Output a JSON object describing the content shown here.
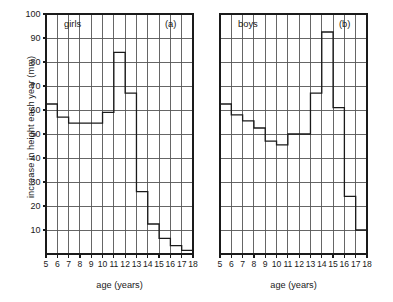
{
  "figure": {
    "ylabel": "increase in height each year (mm)",
    "xlabel_a": "age (years)",
    "xlabel_b": "age (years)"
  },
  "chart_data": [
    {
      "type": "bar",
      "title": "girls",
      "tag": "(a)",
      "xlabel": "age (years)",
      "ylabel": "increase in height each year (mm)",
      "categories": [
        "5-6",
        "6-7",
        "7-8",
        "8-9",
        "9-10",
        "10-11",
        "11-12",
        "12-13",
        "13-14",
        "14-15",
        "15-16",
        "16-17",
        "17-18"
      ],
      "bin_edges": [
        5,
        6,
        7,
        8,
        9,
        10,
        11,
        12,
        13,
        14,
        15,
        16,
        17,
        18
      ],
      "values": [
        62.5,
        57,
        54.5,
        54.5,
        54.5,
        59,
        84,
        67,
        26,
        12.5,
        6.5,
        3.5,
        1.5
      ],
      "xlim": [
        5,
        18
      ],
      "ylim": [
        0,
        100
      ],
      "yticks": [
        10,
        20,
        30,
        40,
        50,
        60,
        70,
        80,
        90,
        100
      ],
      "xticks": [
        5,
        6,
        7,
        8,
        9,
        10,
        11,
        12,
        13,
        14,
        15,
        16,
        17,
        18
      ],
      "grid": true,
      "legend": "none"
    },
    {
      "type": "bar",
      "title": "boys",
      "tag": "(b)",
      "xlabel": "age (years)",
      "ylabel": "increase in height each year (mm)",
      "categories": [
        "5-6",
        "6-7",
        "7-8",
        "8-9",
        "9-10",
        "10-11",
        "11-12",
        "12-13",
        "13-14",
        "14-15",
        "15-16",
        "16-17",
        "17-18"
      ],
      "bin_edges": [
        5,
        6,
        7,
        8,
        9,
        10,
        11,
        12,
        13,
        14,
        15,
        16,
        17,
        18
      ],
      "values": [
        62.5,
        58,
        55.5,
        52.5,
        47,
        45.5,
        50,
        50,
        67,
        92.5,
        61,
        24,
        10,
        5
      ],
      "xlim": [
        5,
        18
      ],
      "ylim": [
        0,
        100
      ],
      "yticks": [
        10,
        20,
        30,
        40,
        50,
        60,
        70,
        80,
        90,
        100
      ],
      "xticks": [
        5,
        6,
        7,
        8,
        9,
        10,
        11,
        12,
        13,
        14,
        15,
        16,
        17,
        18
      ],
      "grid": true,
      "legend": "none"
    }
  ],
  "girls_panel": {
    "title": "girls",
    "tag": "(a)",
    "xlabel": "age (years)",
    "yticks": [
      "100",
      "90",
      "80",
      "70",
      "60",
      "50",
      "40",
      "30",
      "20",
      "10"
    ],
    "xticks": [
      "5",
      "6",
      "7",
      "8",
      "9",
      "10",
      "11",
      "12",
      "13",
      "14",
      "15",
      "16",
      "17",
      "18"
    ]
  },
  "boys_panel": {
    "title": "boys",
    "tag": "(b)",
    "xlabel": "age (years)",
    "xticks": [
      "5",
      "6",
      "7",
      "8",
      "9",
      "10",
      "11",
      "12",
      "13",
      "14",
      "15",
      "16",
      "17",
      "18"
    ]
  },
  "colors": {
    "axis": "#1a1a1a",
    "grid": "#555555",
    "bar_outline": "#1a1a1a",
    "background": "#ffffff"
  }
}
